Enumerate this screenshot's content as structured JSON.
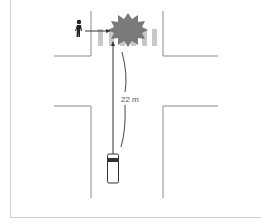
{
  "diagram": {
    "type": "intersection-accident-sketch",
    "distance_label": "22 m",
    "elements": {
      "pedestrian": "pedestrian-icon",
      "collision": "collision-burst-icon",
      "vehicle": "car-icon",
      "crosswalk": "zebra-crossing"
    },
    "colors": {
      "road_edge": "#8a8a8a",
      "crosswalk": "#c8c8c8",
      "burst": "#7a7a7a",
      "path": "#333333",
      "frame": "#cfcfcf"
    }
  }
}
